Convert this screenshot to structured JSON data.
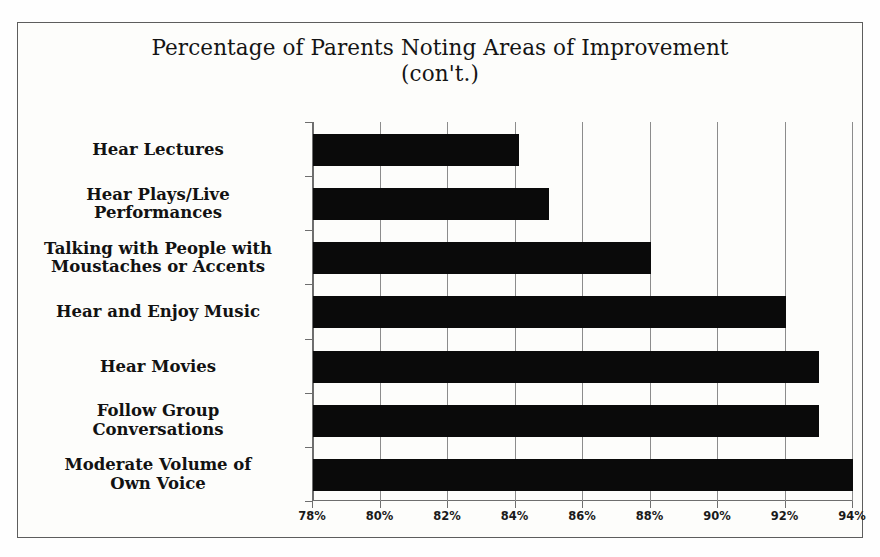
{
  "chart_data": {
    "type": "bar",
    "orientation": "horizontal",
    "title": "Percentage of Parents Noting Areas of Improvement (con't.)",
    "title_line1": "Percentage of Parents Noting Areas of Improvement",
    "title_line2": "(con't.)",
    "xlabel": "",
    "ylabel": "",
    "xlim": [
      78,
      94
    ],
    "xtick_step": 2,
    "xticks": [
      78,
      80,
      82,
      84,
      86,
      88,
      90,
      92,
      94
    ],
    "xtick_labels": [
      "78%",
      "80%",
      "82%",
      "84%",
      "86%",
      "88%",
      "90%",
      "92%",
      "94%"
    ],
    "grid": "vertical",
    "legend": "none",
    "bar_color": "#0a0a0a",
    "categories": [
      "Hear Lectures",
      "Hear Plays/Live Performances",
      "Talking with People with Moustaches or Accents",
      "Hear and Enjoy Music",
      "Hear Movies",
      "Follow Group Conversations",
      "Moderate Volume of Own Voice"
    ],
    "category_lines": [
      [
        "Hear Lectures"
      ],
      [
        "Hear Plays/Live",
        "Performances"
      ],
      [
        "Talking with People with",
        "Moustaches or Accents"
      ],
      [
        "Hear and Enjoy Music"
      ],
      [
        "Hear Movies"
      ],
      [
        "Follow Group",
        "Conversations"
      ],
      [
        "Moderate Volume of",
        "Own Voice"
      ]
    ],
    "values": [
      84.1,
      85.0,
      88.0,
      92.0,
      93.0,
      93.0,
      94.0
    ],
    "value_labels": [
      "84.1%",
      "85%",
      "88%",
      "92%",
      "93%",
      "93%",
      "94%"
    ]
  },
  "frame": {
    "border_color": "#5d5d5d",
    "background": "#fdfdfb"
  }
}
